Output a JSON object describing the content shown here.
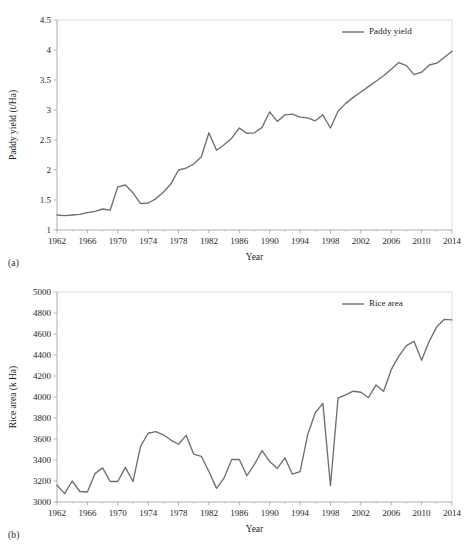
{
  "figure": {
    "panels": [
      {
        "id": "a",
        "caption": "(a)",
        "legend_position": "top-right"
      },
      {
        "id": "b",
        "caption": "(b)",
        "legend_position": "top-right"
      }
    ]
  },
  "colors": {
    "line": "#6f6f6f",
    "axis": "#9a9a9a",
    "text": "#231f20",
    "background": "#ffffff"
  },
  "chart_data": [
    {
      "type": "line",
      "title": "",
      "xlabel": "Year",
      "ylabel": "Paddy yield (t/Ha)",
      "xlim": [
        1962,
        2014
      ],
      "ylim": [
        1,
        4.5
      ],
      "grid": false,
      "legend": [
        "Paddy yield"
      ],
      "legend_position": "upper right",
      "xticks": [
        1962,
        1966,
        1970,
        1974,
        1978,
        1982,
        1986,
        1990,
        1994,
        1998,
        2002,
        2006,
        2010,
        2014
      ],
      "xtick_labels": [
        "1962",
        "1966",
        "1970",
        "1974",
        "1978",
        "1982",
        "1986",
        "1990",
        "1994",
        "1998",
        "2002",
        "2006",
        "2010",
        "2014"
      ],
      "yticks": [
        1,
        1.5,
        2,
        2.5,
        3,
        3.5,
        4,
        4.5
      ],
      "ytick_labels": [
        "1",
        "1.5",
        "2",
        "2.5",
        "3",
        "3.5",
        "4",
        "4.5"
      ],
      "series": [
        {
          "name": "Paddy yield",
          "x": [
            1962,
            1963,
            1964,
            1965,
            1966,
            1967,
            1968,
            1969,
            1970,
            1971,
            1972,
            1973,
            1974,
            1975,
            1976,
            1977,
            1978,
            1979,
            1980,
            1981,
            1982,
            1983,
            1984,
            1985,
            1986,
            1987,
            1988,
            1989,
            1990,
            1991,
            1992,
            1993,
            1994,
            1995,
            1996,
            1997,
            1998,
            1999,
            2000,
            2001,
            2002,
            2003,
            2004,
            2005,
            2006,
            2007,
            2008,
            2009,
            2010,
            2011,
            2012,
            2013,
            2014
          ],
          "values": [
            1.25,
            1.24,
            1.25,
            1.26,
            1.29,
            1.31,
            1.35,
            1.33,
            1.72,
            1.75,
            1.62,
            1.44,
            1.45,
            1.52,
            1.63,
            1.77,
            2.0,
            2.03,
            2.1,
            2.22,
            2.62,
            2.33,
            2.42,
            2.53,
            2.7,
            2.61,
            2.62,
            2.71,
            2.97,
            2.81,
            2.92,
            2.93,
            2.88,
            2.87,
            2.82,
            2.92,
            2.7,
            2.98,
            3.11,
            3.21,
            3.3,
            3.39,
            3.48,
            3.57,
            3.68,
            3.79,
            3.74,
            3.59,
            3.63,
            3.75,
            3.78,
            3.88,
            3.98
          ]
        }
      ]
    },
    {
      "type": "line",
      "title": "",
      "xlabel": "Year",
      "ylabel": "Rice area (k Ha)",
      "xlim": [
        1962,
        2014
      ],
      "ylim": [
        3000,
        5000
      ],
      "grid": false,
      "legend": [
        "Rice area"
      ],
      "legend_position": "upper right",
      "xticks": [
        1962,
        1966,
        1970,
        1974,
        1978,
        1982,
        1986,
        1990,
        1994,
        1998,
        2002,
        2006,
        2010,
        2014
      ],
      "xtick_labels": [
        "1962",
        "1966",
        "1970",
        "1974",
        "1978",
        "1982",
        "1986",
        "1990",
        "1994",
        "1998",
        "2002",
        "2006",
        "2010",
        "2014"
      ],
      "yticks": [
        3000,
        3200,
        3400,
        3600,
        3800,
        4000,
        4200,
        4400,
        4600,
        4800,
        5000
      ],
      "ytick_labels": [
        "3000",
        "3200",
        "3400",
        "3600",
        "3800",
        "4000",
        "4200",
        "4400",
        "4600",
        "4800",
        "5000"
      ],
      "series": [
        {
          "name": "Rice area",
          "x": [
            1962,
            1963,
            1964,
            1965,
            1966,
            1967,
            1968,
            1969,
            1970,
            1971,
            1972,
            1973,
            1974,
            1975,
            1976,
            1977,
            1978,
            1979,
            1980,
            1981,
            1982,
            1983,
            1984,
            1985,
            1986,
            1987,
            1988,
            1989,
            1990,
            1991,
            1992,
            1993,
            1994,
            1995,
            1996,
            1997,
            1998,
            1999,
            2000,
            2001,
            2002,
            2003,
            2004,
            2005,
            2006,
            2007,
            2008,
            2009,
            2010,
            2011,
            2012,
            2013,
            2014
          ],
          "values": [
            3160,
            3080,
            3200,
            3100,
            3095,
            3270,
            3325,
            3195,
            3195,
            3330,
            3195,
            3530,
            3655,
            3670,
            3640,
            3590,
            3550,
            3635,
            3455,
            3435,
            3290,
            3130,
            3230,
            3405,
            3405,
            3250,
            3360,
            3490,
            3385,
            3320,
            3420,
            3265,
            3290,
            3640,
            3850,
            3940,
            3155,
            3990,
            4020,
            4055,
            4045,
            3995,
            4115,
            4055,
            4260,
            4390,
            4490,
            4530,
            4350,
            4530,
            4670,
            4740,
            4735
          ]
        }
      ]
    }
  ]
}
